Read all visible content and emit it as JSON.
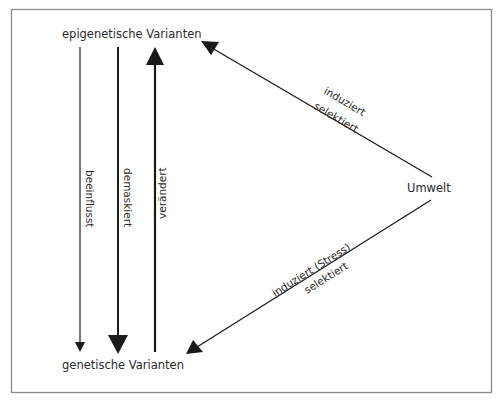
{
  "diagram": {
    "nodes": {
      "epigenetic": {
        "label": "epigenetische Varianten"
      },
      "genetic": {
        "label": "genetische Varianten"
      },
      "environment": {
        "label": "Umwelt"
      }
    },
    "edges": {
      "influences": {
        "label": "beeinflusst",
        "from": "epigenetische Varianten",
        "to": "genetische Varianten"
      },
      "unmasks": {
        "label": "demaskiert",
        "from": "epigenetische Varianten",
        "to": "genetische Varianten"
      },
      "changes": {
        "label": "verändert",
        "from": "genetische Varianten",
        "to": "epigenetische Varianten"
      },
      "env_to_epi": {
        "label_above": "induziert",
        "label_below": "selektiert",
        "from": "Umwelt",
        "to": "epigenetische Varianten"
      },
      "env_to_gen": {
        "label_above": "induziert (Stress)",
        "label_below": "selektiert",
        "from": "Umwelt",
        "to": "genetische Varianten"
      }
    },
    "colors": {
      "stroke": "#1a1a1a",
      "text": "#2a2a2a",
      "frame": "#8c8c8c"
    }
  }
}
